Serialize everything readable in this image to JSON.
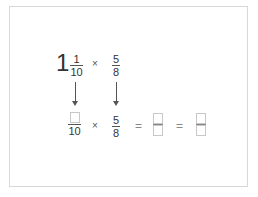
{
  "problem": {
    "row1": {
      "whole": "1",
      "frac1": {
        "num": "1",
        "den": "10"
      },
      "op": "×",
      "frac2": {
        "num": "5",
        "den": "8"
      }
    },
    "row2": {
      "frac1": {
        "num": "",
        "den": "10"
      },
      "op": "×",
      "frac2": {
        "num": "5",
        "den": "8"
      },
      "eq1": "=",
      "answer1": {
        "num": "",
        "den": ""
      },
      "eq2": "=",
      "answer2": {
        "num": "",
        "den": ""
      }
    }
  }
}
